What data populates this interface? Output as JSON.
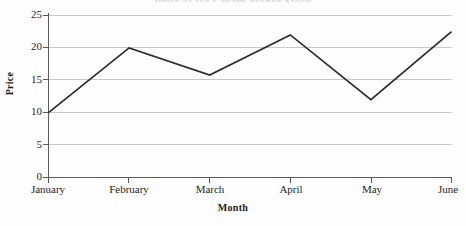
{
  "chart_data": {
    "type": "line",
    "title": "",
    "title_clipped_fragment": "Price of Ice Cream Month Stock",
    "xlabel": "Month",
    "ylabel": "Price",
    "categories": [
      "January",
      "February",
      "March",
      "April",
      "May",
      "June"
    ],
    "values": [
      10,
      20,
      15.8,
      22,
      12,
      22.5
    ],
    "series": [
      {
        "name": "Price",
        "values": [
          10,
          20,
          15.8,
          22,
          12,
          22.5
        ]
      }
    ],
    "ylim": [
      0,
      25
    ],
    "yticks": [
      0,
      5,
      10,
      15,
      20,
      25
    ],
    "ytick_labels": [
      "0",
      "5",
      "10",
      "15",
      "20",
      "25"
    ],
    "grid": "horizontal",
    "legend": "none",
    "line_color": "#2b2b2b",
    "grid_color": "#c9c9c9",
    "axis_color": "#5a5a5a",
    "background_color": "#fefefe"
  }
}
